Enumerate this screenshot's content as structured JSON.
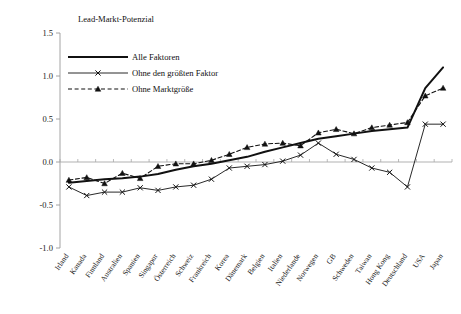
{
  "chart_data": {
    "type": "line",
    "title": "Lead-Markt-Potenzial",
    "xlabel": "",
    "ylabel": "",
    "ylim": [
      -1.0,
      1.5
    ],
    "ytick_labels": [
      "1.5",
      "1.0",
      "0.5",
      "0.0",
      "-0.5",
      "-1.0"
    ],
    "ytick_values": [
      1.5,
      1.0,
      0.5,
      0.0,
      -0.5,
      -1.0
    ],
    "grid": false,
    "zero_line": true,
    "legend_position": "top-left-inside",
    "categories": [
      "Irland",
      "Kanada",
      "Finnland",
      "Australien",
      "Spanien",
      "Singapur",
      "Österreich",
      "Schweiz",
      "Frankreich",
      "Korea",
      "Dänemark",
      "Belgien",
      "Italien",
      "Niederlande",
      "Norwegen",
      "GB",
      "Schweden",
      "Taiwan",
      "Hong Kong",
      "Deutschland",
      "USA",
      "Japan"
    ],
    "series": [
      {
        "name": "Alle Faktoren",
        "marker": "none",
        "dash": "solid",
        "width": 2.0,
        "values": [
          -0.24,
          -0.22,
          -0.2,
          -0.19,
          -0.17,
          -0.14,
          -0.09,
          -0.05,
          -0.02,
          0.02,
          0.06,
          0.12,
          0.17,
          0.22,
          0.27,
          0.3,
          0.33,
          0.36,
          0.38,
          0.4,
          0.86,
          1.1
        ]
      },
      {
        "name": "Ohne den größten Faktor",
        "marker": "x",
        "dash": "solid",
        "width": 0.9,
        "values": [
          -0.29,
          -0.39,
          -0.35,
          -0.35,
          -0.3,
          -0.33,
          -0.29,
          -0.27,
          -0.2,
          -0.07,
          -0.05,
          -0.03,
          0.01,
          0.08,
          0.22,
          0.09,
          0.03,
          -0.07,
          -0.12,
          -0.29,
          0.44,
          0.44
        ]
      },
      {
        "name": "Ohne Marktgröße",
        "marker": "triangle",
        "dash": "dashed",
        "width": 1.1,
        "values": [
          -0.21,
          -0.18,
          -0.25,
          -0.13,
          -0.19,
          -0.05,
          -0.02,
          -0.02,
          0.02,
          0.09,
          0.17,
          0.21,
          0.22,
          0.19,
          0.34,
          0.38,
          0.33,
          0.4,
          0.43,
          0.46,
          0.77,
          0.86
        ]
      }
    ]
  },
  "legend": {
    "items": [
      {
        "label": "Alle Faktoren"
      },
      {
        "label": "Ohne den größten Faktor"
      },
      {
        "label": "Ohne Marktgröße"
      }
    ]
  }
}
